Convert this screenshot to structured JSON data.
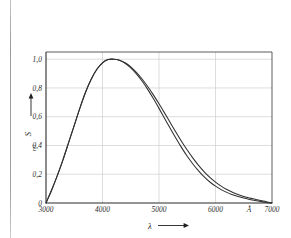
{
  "figure": {
    "background_color": "#ffffff",
    "ink_color": "#2b2b2b",
    "grid_color": "#cfcfcf"
  },
  "chart_data": {
    "type": "line",
    "title": "",
    "subtitle": "",
    "xlabel": "λ",
    "xlabel_arrow": "⟶",
    "ylabel": "S",
    "ylabel_subscript": "rel",
    "ylabel_arrow": "↑",
    "x_unit": "Å",
    "xlim": [
      3000,
      7000
    ],
    "ylim": [
      0,
      1.05
    ],
    "grid": true,
    "grid_axes": "both",
    "legend": "none",
    "legend_position": "none",
    "xticks": [
      3000,
      4000,
      5000,
      6000,
      7000
    ],
    "xtick_labels": [
      "3000",
      "4000",
      "5000",
      "6000",
      "7000"
    ],
    "yticks": [
      0,
      0.2,
      0.4,
      0.6,
      0.8,
      1.0
    ],
    "ytick_labels": [
      "0",
      "0,2",
      "0,4",
      "0,6",
      "0,8",
      "1,0"
    ],
    "x": [
      3000,
      3100,
      3200,
      3300,
      3400,
      3500,
      3600,
      3700,
      3800,
      3900,
      4000,
      4100,
      4200,
      4300,
      4400,
      4500,
      4600,
      4700,
      4800,
      4900,
      5000,
      5100,
      5200,
      5300,
      5400,
      5500,
      5600,
      5700,
      5800,
      5900,
      6000,
      6100,
      6200,
      6300,
      6400,
      6500,
      6600,
      6700,
      6800,
      6900,
      7000
    ],
    "series": [
      {
        "name": "curve-upper",
        "values": [
          0.0,
          0.09,
          0.19,
          0.3,
          0.42,
          0.54,
          0.66,
          0.77,
          0.86,
          0.93,
          0.975,
          0.997,
          1.0,
          0.993,
          0.975,
          0.946,
          0.908,
          0.862,
          0.81,
          0.752,
          0.69,
          0.625,
          0.558,
          0.492,
          0.428,
          0.368,
          0.312,
          0.262,
          0.217,
          0.178,
          0.145,
          0.117,
          0.094,
          0.075,
          0.059,
          0.046,
          0.035,
          0.026,
          0.017,
          0.009,
          0.0
        ]
      },
      {
        "name": "curve-lower",
        "values": [
          0.0,
          0.09,
          0.19,
          0.3,
          0.42,
          0.54,
          0.66,
          0.77,
          0.86,
          0.93,
          0.975,
          0.997,
          1.0,
          0.992,
          0.972,
          0.94,
          0.898,
          0.848,
          0.79,
          0.726,
          0.658,
          0.588,
          0.518,
          0.45,
          0.385,
          0.325,
          0.271,
          0.223,
          0.181,
          0.146,
          0.117,
          0.093,
          0.074,
          0.058,
          0.045,
          0.034,
          0.025,
          0.017,
          0.01,
          0.004,
          0.0
        ]
      }
    ],
    "annotations": [
      {
        "name": "peak",
        "x": 4200,
        "y": 1.0,
        "text": ""
      }
    ]
  }
}
